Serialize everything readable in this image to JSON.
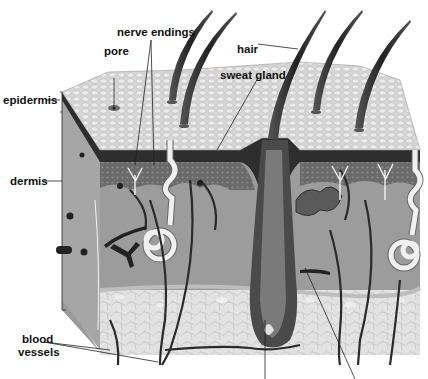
{
  "diagram": {
    "labels": {
      "nerve_endings": "nerve endings",
      "pore": "pore",
      "hair": "hair",
      "sweat_gland": "sweat gland",
      "epidermis": "epidermis",
      "dermis": "dermis",
      "blood_vessels_line1": "blood",
      "blood_vessels_line2": "vessels"
    },
    "colors": {
      "background": "#ffffff",
      "surface": "#d8d8d8",
      "epidermis_band": "#3a3a3a",
      "dermis": "#8e8e8e",
      "subcutaneous": "#dcdcdc",
      "hair": "#3c3c3c",
      "label_text": "#111111"
    }
  }
}
